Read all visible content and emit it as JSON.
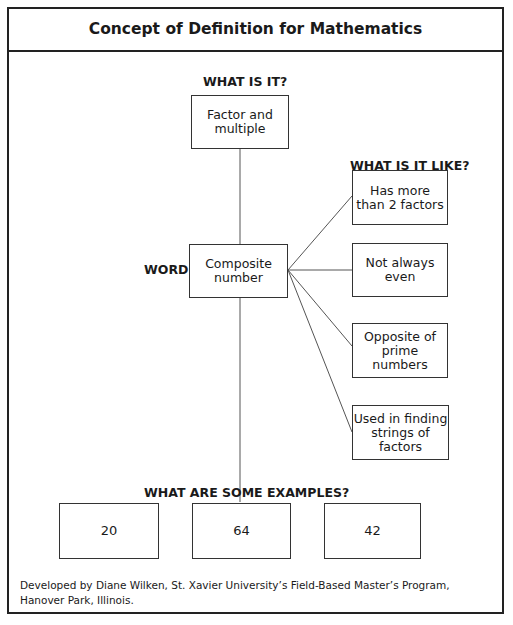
{
  "title": "Concept of Definition for Mathematics",
  "labels": {
    "what_is_it": "WHAT IS IT?",
    "what_is_it_like": "WHAT IS IT LIKE?",
    "word": "WORD",
    "examples": "WHAT ARE SOME EXAMPLES?"
  },
  "what_is_it": "Factor and\nmultiple",
  "word": "Composite\nnumber",
  "properties": [
    "Has more\nthan 2 factors",
    "Not always\neven",
    "Opposite of\nprime numbers",
    "Used in finding\nstrings of\nfactors"
  ],
  "examples": [
    "20",
    "64",
    "42"
  ],
  "footer": "Developed by Diane Wilken, St. Xavier University’s Field-Based Master’s Program, Hanover Park, Illinois.",
  "colors": {
    "line": "#333333",
    "border": "#222222",
    "text": "#1a1a1a"
  }
}
